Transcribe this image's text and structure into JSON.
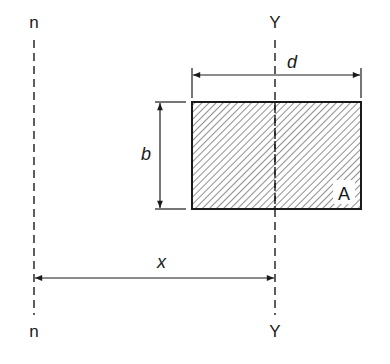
{
  "diagram": {
    "type": "parallel-axis-theorem-section",
    "axes": {
      "n_top": "n",
      "n_bottom": "n",
      "y_top": "Y",
      "y_bottom": "Y"
    },
    "dimensions": {
      "width_label": "d",
      "height_label": "b",
      "offset_label": "x"
    },
    "area_label": "A",
    "colors": {
      "line": "#1a1a1a",
      "background": "#ffffff"
    }
  }
}
